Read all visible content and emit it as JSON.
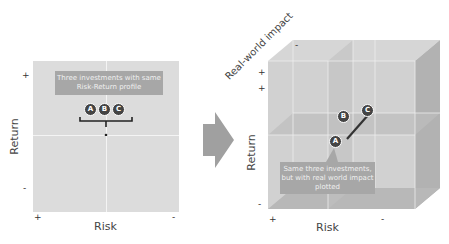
{
  "left_panel": {
    "callout": "Three investments with same Risk-Return profile",
    "markers": [
      "A",
      "B",
      "C"
    ],
    "y_axis": {
      "label": "Return",
      "plus": "+",
      "minus": "-"
    },
    "x_axis": {
      "label": "Risk",
      "plus": "+",
      "minus": "-"
    }
  },
  "arrow": {
    "direction": "right"
  },
  "right_panel": {
    "callout": "Same three investments, but with real world impact plotted",
    "markers": [
      "A",
      "B",
      "C"
    ],
    "z_axis": {
      "label": "Real-world impact",
      "plus": "+",
      "minus": "-"
    },
    "y_axis": {
      "label": "Return",
      "plus": "+",
      "minus": "-"
    },
    "x_axis": {
      "label": "Risk",
      "plus": "+",
      "minus": "-"
    }
  },
  "colors": {
    "panel": "#dcdcdc",
    "callout": "#a7a7a7",
    "marker": "#444444",
    "arrow": "#a0a0a0"
  }
}
